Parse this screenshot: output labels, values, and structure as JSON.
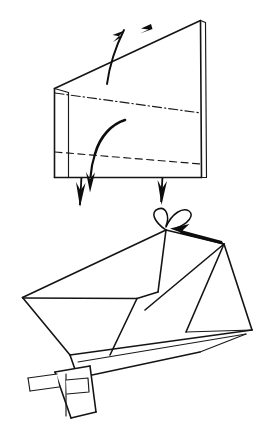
{
  "document": {
    "title": "Origami folding instruction diagram",
    "kind": "line-drawing",
    "background_color": "#ffffff",
    "ink_color": "#141414",
    "width": 267,
    "height": 444,
    "text_labels": [],
    "step_numbers": []
  },
  "figures": [
    {
      "id": "upper-figure",
      "name": "upper-model-step",
      "description": "Tall wedge-shaped folded paper form seen in three-quarter view, with a double-thickness left edge and a double-thickness right edge, one mountain fold crossing the middle and one valley fold crossing the lower portion.",
      "fold_lines": [
        {
          "type": "mountain",
          "label": "upper-mountain-fold",
          "style": "dash-dot"
        },
        {
          "type": "valley",
          "label": "lower-valley-fold",
          "style": "dashed"
        }
      ],
      "arrows": [
        {
          "id": "arrow-fold-top",
          "type": "curved-fold-arrow",
          "direction": "down-then-up-left",
          "label": "top-fold-arrow"
        },
        {
          "id": "arrow-fold-middle",
          "type": "curved-fold-arrow",
          "direction": "down",
          "label": "middle-fold-arrow"
        },
        {
          "id": "arrow-pull-left",
          "type": "straight-arrow",
          "direction": "down",
          "label": "left-pull-down-arrow"
        },
        {
          "id": "arrow-pull-right",
          "type": "straight-arrow",
          "direction": "down",
          "label": "right-pull-down-arrow"
        }
      ]
    },
    {
      "id": "lower-figure",
      "name": "lower-model-step",
      "description": "Resulting opened box-like form shown from above at an angle, with a wide quadrilateral opening, a triangular flap on the right, a long tapering body to the lower right, and a small rectangular tab protruding at the lower left.",
      "features": [
        {
          "id": "opening-panel",
          "label": "large-open-panel"
        },
        {
          "id": "right-triangular-flap",
          "label": "right-triangle-flap"
        },
        {
          "id": "lower-body",
          "label": "tapering-lower-body"
        },
        {
          "id": "left-tab",
          "label": "protruding-tab"
        }
      ],
      "arrows": [
        {
          "id": "arrow-twist",
          "type": "curl-loop",
          "direction": "twist",
          "label": "twist-curl-symbol"
        },
        {
          "id": "arrow-point-in",
          "type": "straight-arrow",
          "direction": "up-left",
          "label": "push-in-arrow"
        }
      ]
    }
  ]
}
